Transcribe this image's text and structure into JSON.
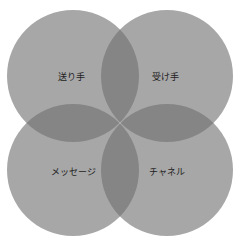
{
  "diagram": {
    "type": "four-circle-venn",
    "colors": {
      "circle": "#a7a7a7",
      "overlap": "#858585",
      "text": "#1e1e1e",
      "background": "#ffffff"
    },
    "circles": [
      {
        "id": "sender",
        "label": "送り手",
        "cx": 73,
        "cy": 76
      },
      {
        "id": "receiver",
        "label": "受け手",
        "cx": 167,
        "cy": 76
      },
      {
        "id": "message",
        "label": "メッセージ",
        "cx": 73,
        "cy": 170
      },
      {
        "id": "channel",
        "label": "チャネル",
        "cx": 167,
        "cy": 170
      }
    ],
    "radius": 66
  }
}
